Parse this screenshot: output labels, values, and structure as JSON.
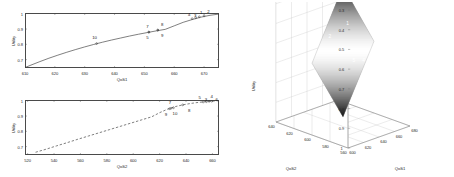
{
  "figure": {
    "panels": [
      "utility-vs-qos1",
      "utility-vs-qos2",
      "utility-surface-3d"
    ]
  },
  "chart_data": [
    {
      "id": "top-2d",
      "type": "line",
      "title": "",
      "xlabel": "QoS1",
      "ylabel": "Utility",
      "xlim": [
        610,
        675
      ],
      "ylim": [
        0.645,
        1.005
      ],
      "xticks": [
        610,
        620,
        630,
        640,
        650,
        660,
        670
      ],
      "yticks": [
        0.7,
        0.8,
        0.9,
        1
      ],
      "ytick_labels": [
        "0.7",
        "0.8",
        "0.9",
        "1"
      ],
      "grid": false,
      "line_style": "solid",
      "line_color": "#3a3a3a",
      "x": [
        610,
        612,
        615,
        618,
        621,
        624,
        627,
        630,
        633,
        636,
        639,
        642,
        645,
        648,
        651,
        654,
        657,
        660,
        663,
        666,
        669,
        672,
        675
      ],
      "y": [
        0.648,
        0.664,
        0.687,
        0.709,
        0.729,
        0.748,
        0.766,
        0.783,
        0.799,
        0.814,
        0.828,
        0.841,
        0.854,
        0.866,
        0.877,
        0.888,
        0.898,
        0.921,
        0.944,
        0.962,
        0.978,
        0.99,
        0.998
      ],
      "markers": [
        {
          "label": "10",
          "x": 634.0,
          "y": 0.805,
          "label_dx": -2.0,
          "label_dy": -6.5
        },
        {
          "label": "7",
          "x": 651.5,
          "y": 0.88,
          "label_dx": -1.5,
          "label_dy": -6.5
        },
        {
          "label": "5",
          "x": 651.5,
          "y": 0.88,
          "label_dx": -1.5,
          "label_dy": 5.0
        },
        {
          "label": "8",
          "x": 654.5,
          "y": 0.893,
          "label_dx": 4.5,
          "label_dy": -6.5
        },
        {
          "label": "9",
          "x": 654.5,
          "y": 0.893,
          "label_dx": 4.5,
          "label_dy": 5.0
        },
        {
          "label": "4",
          "x": 666.0,
          "y": 0.968,
          "label_dx": -3.0,
          "label_dy": -4.5
        },
        {
          "label": "3",
          "x": 667.2,
          "y": 0.974,
          "label_dx": -0.5,
          "label_dy": -3.0
        },
        {
          "label": "1",
          "x": 668.4,
          "y": 0.98,
          "label_dx": 1.8,
          "label_dy": -4.5
        },
        {
          "label": "2",
          "x": 670.0,
          "y": 0.986,
          "label_dx": 4.5,
          "label_dy": -4.5
        }
      ]
    },
    {
      "id": "bottom-2d",
      "type": "line",
      "title": "",
      "xlabel": "QoS2",
      "ylabel": "Utility",
      "xlim": [
        518,
        665
      ],
      "ylim": [
        0.645,
        1.005
      ],
      "xticks": [
        520,
        540,
        560,
        580,
        600,
        620,
        640,
        660
      ],
      "yticks": [
        0.7,
        0.8,
        0.9,
        1
      ],
      "ytick_labels": [
        "0.7",
        "0.8",
        "0.9",
        "1"
      ],
      "grid": false,
      "line_style": "dashed",
      "line_color": "#3a3a3a",
      "x": [
        526,
        534,
        542,
        550,
        558,
        566,
        574,
        582,
        590,
        598,
        606,
        614,
        620,
        626,
        632,
        638,
        644,
        650,
        656,
        662,
        665
      ],
      "y": [
        0.663,
        0.683,
        0.705,
        0.726,
        0.748,
        0.769,
        0.79,
        0.811,
        0.832,
        0.853,
        0.874,
        0.895,
        0.922,
        0.945,
        0.962,
        0.974,
        0.983,
        0.99,
        0.995,
        0.999,
        1.0
      ],
      "markers": [
        {
          "label": "9",
          "x": 627.5,
          "y": 0.948,
          "label_dx": -3.5,
          "label_dy": 5.5
        },
        {
          "label": "10",
          "x": 630.5,
          "y": 0.954,
          "label_dx": 1.5,
          "label_dy": 5.5
        },
        {
          "label": "7",
          "x": 628.5,
          "y": 0.95,
          "label_dx": -1.0,
          "label_dy": -6.0
        },
        {
          "label": "8",
          "x": 637.5,
          "y": 0.973,
          "label_dx": 6.5,
          "label_dy": 5.5
        },
        {
          "label": "5",
          "x": 653.0,
          "y": 0.992,
          "label_dx": -3.5,
          "label_dy": -4.5
        },
        {
          "label": "3",
          "x": 655.5,
          "y": 0.994,
          "label_dx": -0.5,
          "label_dy": -3.0
        },
        {
          "label": "4",
          "x": 657.5,
          "y": 0.996,
          "label_dx": 2.5,
          "label_dy": -5.0
        },
        {
          "label": "6",
          "x": 659.5,
          "y": 0.997,
          "label_dx": 5.0,
          "label_dy": -2.0
        }
      ]
    },
    {
      "id": "surface-3d",
      "type": "surface",
      "title": "",
      "xlabel": "QoS1",
      "ylabel": "QoS2",
      "zlabel": "Utility",
      "zticks": [
        0.3,
        0.4,
        0.5,
        0.6,
        0.7,
        0.8,
        0.9,
        1
      ],
      "ztick_labels": [
        "0.3",
        "0.4",
        "0.5",
        "0.6",
        "0.7",
        "0.8",
        "0.9",
        "1"
      ],
      "xticks": [
        600,
        620,
        640,
        660,
        680
      ],
      "xtick_labels": [
        "600",
        "620",
        "640",
        "660",
        "680"
      ],
      "yticks": [
        560,
        580,
        600,
        620,
        640
      ],
      "ytick_labels": [
        "560",
        "580",
        "600",
        "620",
        "640"
      ],
      "grid": true,
      "colormap": "gray",
      "markers": [
        {
          "label": "1",
          "x": 0.512,
          "y": 0.12
        },
        {
          "label": "2",
          "x": 0.43,
          "y": 0.192
        },
        {
          "label": "3",
          "x": 0.488,
          "y": 0.262
        },
        {
          "label": "5",
          "x": 0.54,
          "y": 0.33
        },
        {
          "label": "4",
          "x": 0.585,
          "y": 0.33
        },
        {
          "label": "6",
          "x": 0.62,
          "y": 0.326
        },
        {
          "label": "7",
          "x": 0.66,
          "y": 0.316
        }
      ]
    }
  ]
}
